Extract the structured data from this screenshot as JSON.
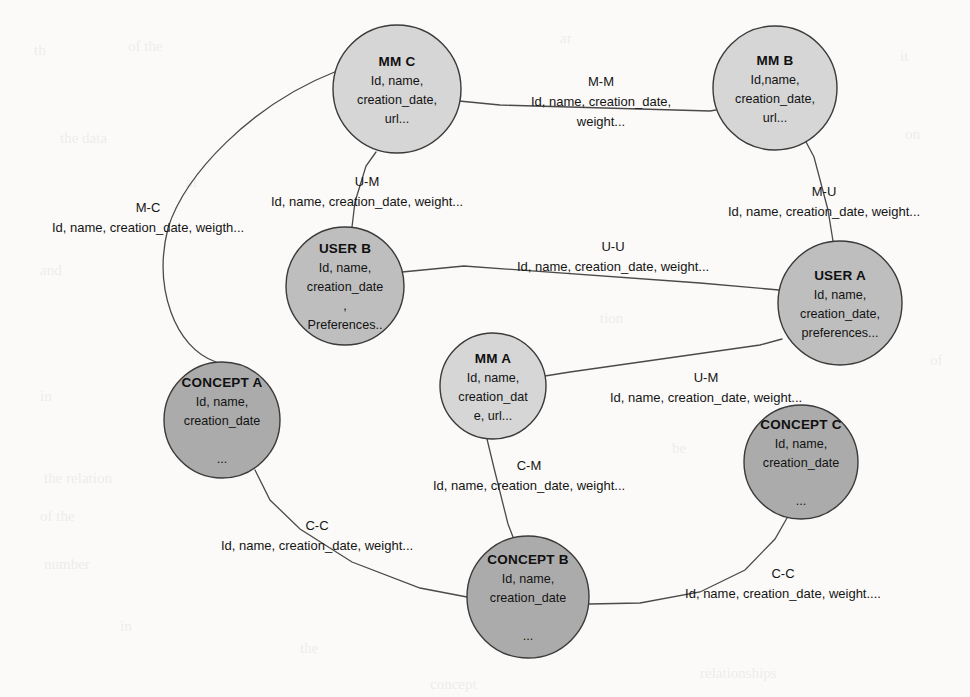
{
  "canvas": {
    "width": 970,
    "height": 697,
    "background": "#fbfaf8"
  },
  "palette": {
    "mm_fill": "#d6d6d6",
    "user_fill": "#bebebe",
    "concept_fill": "#ababab",
    "node_stroke": "#3a3a3a",
    "edge_stroke": "#4a4a4a",
    "text": "#131313"
  },
  "nodes": [
    {
      "id": "mm-c",
      "kind": "mm",
      "title": "MM C",
      "attrs": [
        "Id, name,",
        "creation_date,",
        "url..."
      ],
      "cx": 397,
      "cy": 89,
      "r": 64,
      "fill": "#d6d6d6"
    },
    {
      "id": "mm-b",
      "kind": "mm",
      "title": "MM B",
      "attrs": [
        "Id,name,",
        "creation_date,",
        "url..."
      ],
      "cx": 775,
      "cy": 88,
      "r": 62,
      "fill": "#d6d6d6"
    },
    {
      "id": "user-b",
      "kind": "user",
      "title": "USER B",
      "attrs": [
        "Id, name,",
        "creation_date",
        ",",
        "Preferences.."
      ],
      "cx": 345,
      "cy": 286,
      "r": 59,
      "fill": "#bebebe"
    },
    {
      "id": "user-a",
      "kind": "user",
      "title": "USER A",
      "attrs": [
        "Id, name,",
        "creation_date,",
        "preferences..."
      ],
      "cx": 840,
      "cy": 303,
      "r": 62,
      "fill": "#bebebe"
    },
    {
      "id": "mm-a",
      "kind": "mm",
      "title": "MM A",
      "attrs": [
        "Id, name,",
        "creation_dat",
        "e, url..."
      ],
      "cx": 493,
      "cy": 386,
      "r": 53,
      "fill": "#d6d6d6"
    },
    {
      "id": "concept-a",
      "kind": "concept",
      "title": "CONCEPT A",
      "attrs": [
        "Id, name,",
        "creation_date",
        "",
        "..."
      ],
      "cx": 222,
      "cy": 420,
      "r": 58,
      "fill": "#ababab"
    },
    {
      "id": "concept-c",
      "kind": "concept",
      "title": "CONCEPT C",
      "attrs": [
        "Id, name,",
        "creation_date",
        "",
        "..."
      ],
      "cx": 801,
      "cy": 462,
      "r": 57,
      "fill": "#ababab"
    },
    {
      "id": "concept-b",
      "kind": "concept",
      "title": "CONCEPT B",
      "attrs": [
        "Id, name,",
        "creation_date",
        "",
        "..."
      ],
      "cx": 528,
      "cy": 597,
      "r": 61,
      "fill": "#ababab"
    }
  ],
  "edges": [
    {
      "id": "edge-mm-m-m",
      "from": "mm-c",
      "to": "mm-b",
      "type": "M-M",
      "attrs": "Id, name, creation_date,",
      "attrs2": "weight...",
      "path": "M 459 101 L 500 105 L 710 111 L 716 110",
      "label_x": 601,
      "label_y": 86
    },
    {
      "id": "edge-mm-c-user-b",
      "from": "mm-c",
      "to": "user-b",
      "type": "U-M",
      "attrs": "Id, name, creation_date, weight...",
      "path": "M 376 152 L 366 166 L 355 202 L 352 227",
      "label_x": 367,
      "label_y": 186
    },
    {
      "id": "edge-mm-c-concept-a",
      "from": "mm-c",
      "to": "concept-a",
      "type": "M-C",
      "attrs": "Id, name, creation_date, weigth...",
      "path": "M 337 71 C 250 105 185 175 168 228 C 153 288 175 348 216 362",
      "label_x": 148,
      "label_y": 212
    },
    {
      "id": "edge-mm-b-user-a",
      "from": "mm-b",
      "to": "user-a",
      "type": "M-U",
      "attrs": "Id, name, creation_date, weight...",
      "path": "M 805 140 L 814 157 L 828 210 L 833 241",
      "label_x": 824,
      "label_y": 196
    },
    {
      "id": "edge-user-u-u",
      "from": "user-b",
      "to": "user-a",
      "type": "U-U",
      "attrs": "Id, name, creation_date, weight...",
      "path": "M 402 272 L 464 266 L 700 283 L 779 290",
      "label_x": 613,
      "label_y": 251
    },
    {
      "id": "edge-mm-a-user-a",
      "from": "mm-a",
      "to": "user-a",
      "type": "U-M",
      "attrs": "Id, name, creation_date, weight...",
      "path": "M 545 376 L 570 372 L 760 345 L 782 339",
      "label_x": 706,
      "label_y": 382
    },
    {
      "id": "edge-mm-a-concept-b",
      "from": "mm-a",
      "to": "concept-b",
      "type": "C-M",
      "attrs": "Id, name, creation_date, weight...",
      "path": "M 487 439 L 494 468 L 508 524 L 513 537",
      "label_x": 529,
      "label_y": 470
    },
    {
      "id": "edge-concept-a-concept-b",
      "from": "concept-a",
      "to": "concept-b",
      "type": "C-C",
      "attrs": "Id, name, creation_date, weight...",
      "path": "M 255 470 L 270 500 L 300 529 L 352 562 L 420 588 L 467 597",
      "label_x": 317,
      "label_y": 530
    },
    {
      "id": "edge-concept-c-concept-b",
      "from": "concept-c",
      "to": "concept-b",
      "type": "C-C",
      "attrs": "Id, name, creation_date, weight....",
      "path": "M 787 518 L 775 539 L 745 570 L 700 592 L 640 603 L 589 604",
      "label_x": 783,
      "label_y": 578
    }
  ],
  "ghost_marks": [
    {
      "text": "th",
      "x": 34,
      "y": 42,
      "size": 15
    },
    {
      "text": "of the",
      "x": 128,
      "y": 38,
      "size": 15
    },
    {
      "text": "ar",
      "x": 560,
      "y": 30,
      "size": 15
    },
    {
      "text": "it",
      "x": 900,
      "y": 48,
      "size": 15
    },
    {
      "text": "the data",
      "x": 60,
      "y": 130,
      "size": 15
    },
    {
      "text": "on",
      "x": 905,
      "y": 126,
      "size": 15
    },
    {
      "text": "al",
      "x": 186,
      "y": 174,
      "size": 15
    },
    {
      "text": "and",
      "x": 40,
      "y": 262,
      "size": 15
    },
    {
      "text": "tion",
      "x": 600,
      "y": 310,
      "size": 15
    },
    {
      "text": "of",
      "x": 930,
      "y": 352,
      "size": 15
    },
    {
      "text": "in",
      "x": 40,
      "y": 388,
      "size": 15
    },
    {
      "text": "be",
      "x": 672,
      "y": 440,
      "size": 15
    },
    {
      "text": "the relation",
      "x": 44,
      "y": 470,
      "size": 15
    },
    {
      "text": "of the",
      "x": 40,
      "y": 508,
      "size": 15
    },
    {
      "text": "number",
      "x": 44,
      "y": 556,
      "size": 15
    },
    {
      "text": "the",
      "x": 300,
      "y": 640,
      "size": 15
    },
    {
      "text": "in",
      "x": 120,
      "y": 618,
      "size": 15
    },
    {
      "text": "concept",
      "x": 430,
      "y": 676,
      "size": 15
    },
    {
      "text": "relationships",
      "x": 700,
      "y": 665,
      "size": 15
    }
  ]
}
